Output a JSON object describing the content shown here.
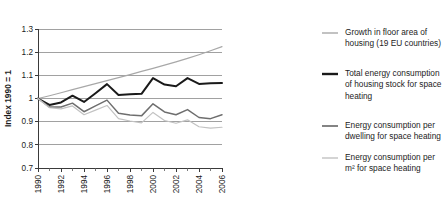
{
  "chart_data": {
    "type": "line",
    "title": "",
    "xlabel": "",
    "ylabel": "Index 1990 = 1",
    "xlim": [
      1990,
      2006
    ],
    "ylim": [
      0.7,
      1.3
    ],
    "grid": true,
    "legend_position": "right",
    "x": [
      1990,
      1991,
      1992,
      1993,
      1994,
      1995,
      1996,
      1997,
      1998,
      1999,
      2000,
      2001,
      2002,
      2003,
      2004,
      2005,
      2006
    ],
    "ytick_labels": [
      "0.7",
      "0.8",
      "0.9",
      "1",
      "1.1",
      "1.2",
      "1.3"
    ],
    "ytick_values": [
      0.7,
      0.8,
      0.9,
      1.0,
      1.1,
      1.2,
      1.3
    ],
    "xtick_labels": [
      "1990",
      "1992",
      "1994",
      "1996",
      "1998",
      "2000",
      "2002",
      "2004",
      "2006"
    ],
    "xtick_values": [
      1990,
      1992,
      1994,
      1996,
      1998,
      2000,
      2002,
      2004,
      2006
    ],
    "series": [
      {
        "name": "Growth in floor area of housing (19 EU countries)",
        "color": "#a8a8a8",
        "width": 1.2,
        "values": [
          1.0,
          1.012,
          1.025,
          1.038,
          1.051,
          1.064,
          1.077,
          1.09,
          1.103,
          1.117,
          1.13,
          1.144,
          1.158,
          1.173,
          1.189,
          1.206,
          1.224
        ]
      },
      {
        "name": "Total energy consumption of housing stock for space heating",
        "color": "#1a1a1a",
        "width": 2.0,
        "values": [
          1.0,
          0.972,
          0.983,
          1.012,
          0.985,
          1.023,
          1.062,
          1.015,
          1.018,
          1.02,
          1.088,
          1.06,
          1.053,
          1.088,
          1.063,
          1.066,
          1.067
        ]
      },
      {
        "name": "Energy consumption per dwelling for space heating",
        "color": "#6e6e6e",
        "width": 1.5,
        "values": [
          1.0,
          0.963,
          0.963,
          0.98,
          0.943,
          0.968,
          0.993,
          0.936,
          0.929,
          0.925,
          0.977,
          0.942,
          0.93,
          0.952,
          0.918,
          0.913,
          0.93
        ]
      },
      {
        "name": "Energy consumption per m² for space heating",
        "color": "#c2c2c2",
        "width": 1.2,
        "values": [
          1.0,
          0.96,
          0.955,
          0.968,
          0.93,
          0.95,
          0.97,
          0.913,
          0.903,
          0.895,
          0.94,
          0.905,
          0.893,
          0.908,
          0.878,
          0.872,
          0.876
        ]
      }
    ]
  },
  "legend": {
    "items": [
      {
        "label_line1": "Growth in floor area of",
        "label_line2": "housing (19 EU countries)",
        "label_line3": "",
        "color": "#a8a8a8",
        "width": 1.4
      },
      {
        "label_line1": "Total energy consumption",
        "label_line2": "of housing stock for space",
        "label_line3": "heating",
        "color": "#1a1a1a",
        "width": 2.4
      },
      {
        "label_line1": "Energy consumption per",
        "label_line2": "dwelling for space heating",
        "label_line3": "",
        "color": "#6e6e6e",
        "width": 1.7
      },
      {
        "label_line1": "Energy consumption per",
        "label_line2": "m² for space heating",
        "label_line3": "",
        "color": "#c2c2c2",
        "width": 1.4
      }
    ]
  },
  "axis": {
    "y_title": "Index 1990 = 1"
  }
}
